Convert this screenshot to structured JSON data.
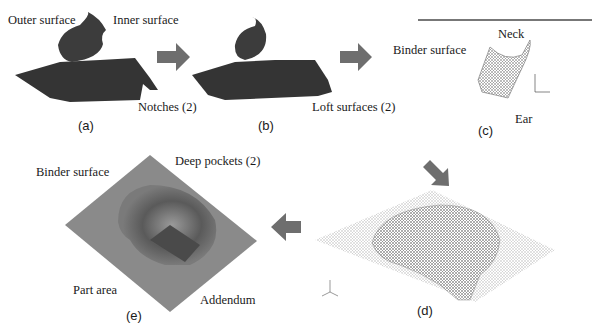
{
  "panels": {
    "a": {
      "caption": "(a)",
      "labels": {
        "outer": "Outer surface",
        "inner": "Inner surface",
        "notches": "Notches (2)"
      }
    },
    "b": {
      "caption": "(b)",
      "labels": {
        "loft": "Loft surfaces (2)"
      }
    },
    "c": {
      "caption": "(c)",
      "labels": {
        "binder": "Binder surface",
        "neck": "Neck",
        "ear": "Ear"
      },
      "axes": {
        "z": "z",
        "x": "x",
        "y": "y"
      }
    },
    "d": {
      "caption": "(d)",
      "axes": {
        "z": "z",
        "x": "x",
        "y": "y"
      }
    },
    "e": {
      "caption": "(e)",
      "labels": {
        "binder": "Binder surface",
        "pockets": "Deep pockets (2)",
        "part": "Part area",
        "addendum": "Addendum"
      }
    }
  },
  "colors": {
    "arrow": "#6e6e6e",
    "part": "#3a3a3a",
    "binder_shaded": "#8a8a8a",
    "mesh": "#9a9a9a"
  }
}
